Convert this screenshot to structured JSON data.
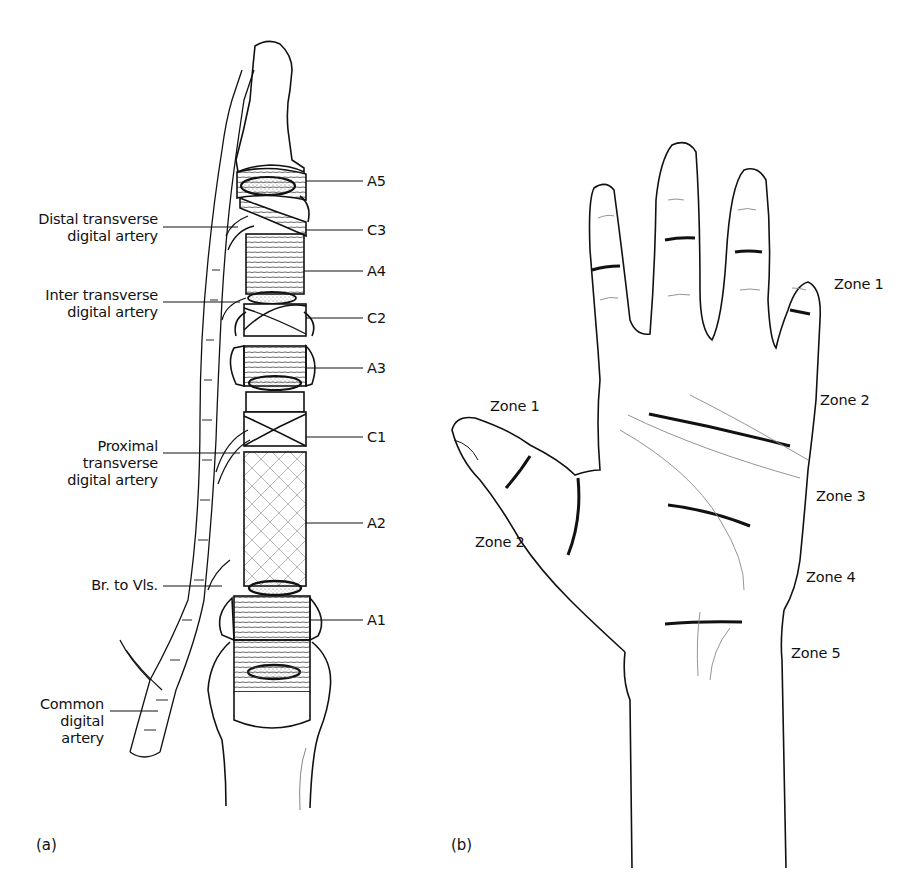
{
  "figure": {
    "panel_a": {
      "panel_label": "(a)",
      "title": "Digital flexor tendon sheath pulleys and vincular blood supply",
      "pulley_labels": {
        "a5": "A5",
        "c3": "C3",
        "a4": "A4",
        "c2": "C2",
        "a3": "A3",
        "c1": "C1",
        "a2": "A2",
        "a1": "A1"
      },
      "artery_labels": {
        "distal_line1": "Distal transverse",
        "distal_line2": "digital artery",
        "inter_line1": "Inter transverse",
        "inter_line2": "digital artery",
        "proximal_line1": "Proximal",
        "proximal_line2": "transverse",
        "proximal_line3": "digital artery",
        "br_vls": "Br. to Vls.",
        "common_line1": "Common",
        "common_line2": "digital",
        "common_line3": "artery"
      }
    },
    "panel_b": {
      "panel_label": "(b)",
      "title": "Flexor tendon injury zones of the hand",
      "zone_labels": {
        "fingers_zone1": "Zone 1",
        "fingers_zone2": "Zone 2",
        "zone3": "Zone 3",
        "zone4": "Zone 4",
        "zone5": "Zone 5",
        "thumb_zone1": "Zone 1",
        "thumb_zone2": "Zone 2"
      }
    }
  },
  "colors": {
    "ink": "#111111",
    "background": "#ffffff",
    "hatch": "#555555"
  }
}
